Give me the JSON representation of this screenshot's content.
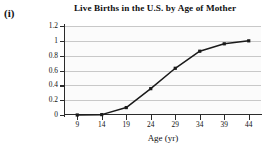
{
  "figure": {
    "label": "(i)"
  },
  "chart_data": {
    "type": "line",
    "title": "Live Births in the U.S. by Age of Mother",
    "xlabel": "Age (yr)",
    "ylabel": "Cumulative Relative Frequency",
    "ylabel_lines": [
      "Cumulative Relative",
      "Frequency"
    ],
    "x": [
      9,
      14,
      19,
      24,
      29,
      34,
      39,
      44
    ],
    "values": [
      0,
      0.005,
      0.1,
      0.355,
      0.63,
      0.86,
      0.96,
      1
    ],
    "categories": [
      "9",
      "14",
      "19",
      "24",
      "29",
      "34",
      "39",
      "44"
    ],
    "xtick_labels": [
      "9",
      "14",
      "19",
      "24",
      "29",
      "34",
      "39",
      "44"
    ],
    "ytick_labels": [
      "0",
      "0.2",
      "0.4",
      "0.6",
      "0.8",
      "1",
      "1.2"
    ],
    "ytick_values": [
      0,
      0.2,
      0.4,
      0.6,
      0.8,
      1,
      1.2
    ],
    "xlim": [
      6.5,
      46.5
    ],
    "ylim": [
      0,
      1.2
    ],
    "grid": "horizontal",
    "legend": "none",
    "marker": "square",
    "line_color": "#1a1a1a",
    "grid_color": "#c8c8c8",
    "axis_color": "#2b2b2b",
    "plot_background": "#fbfbfb"
  }
}
